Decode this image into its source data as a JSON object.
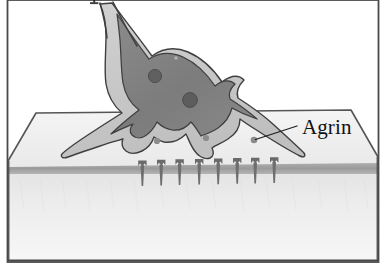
{
  "figure": {
    "title_visible": false,
    "caption": "",
    "background_color": "#ffffff",
    "width": 389,
    "height": 273
  },
  "labels": [
    {
      "id": "agrin",
      "text": "Agrin",
      "x": 302,
      "y": 134,
      "font_size": 21,
      "color": "#111111",
      "leader_line": {
        "from_x": 254,
        "from_y": 140,
        "to_x": 297,
        "to_y": 126
      }
    }
  ],
  "cropped_text_top": {
    "text": "",
    "note": "partial glyph descender clipped at the top edge of the crop",
    "x": 92,
    "y": 4
  },
  "colors": {
    "outline": "#3a3a3a",
    "neuron_cytoplasm": "#7e7e7e",
    "neuron_membrane": "#c7c7c7",
    "vesicle": "#616161",
    "muscle_top_face": "#efefef",
    "muscle_front_face": "#ebebeb",
    "muscle_membrane_band": "#9a9a9a",
    "receptor": "#666666",
    "agrin_particle": "#8c8c8c",
    "frame_border": "#4a4a4a"
  },
  "structures": {
    "axon": {
      "name": "axon-neurite",
      "count": 1,
      "enters_from": "top-left"
    },
    "growth_cone": {
      "name": "nerve-terminal-growth-cone",
      "vesicle_count": 2,
      "lamellipodia_count": 4
    },
    "muscle_block": {
      "name": "muscle-fiber-block",
      "top_face": true,
      "membrane_band": true,
      "beveled_corners": [
        "top-left",
        "top-right"
      ]
    },
    "receptors": {
      "name": "acetylcholine-receptor",
      "count": 8,
      "positions_x": [
        142,
        161,
        179,
        199,
        218,
        237,
        255,
        274
      ],
      "membrane_y": 174
    },
    "agrin_particles": {
      "name": "agrin-particle",
      "count": 3,
      "positions": [
        {
          "x": 157,
          "y": 141
        },
        {
          "x": 206,
          "y": 138
        },
        {
          "x": 254,
          "y": 140
        }
      ]
    }
  },
  "frame": {
    "visible": true,
    "stroke_width": 2,
    "color": "#4a4a4a"
  }
}
